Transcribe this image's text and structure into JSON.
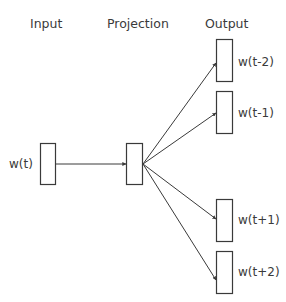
{
  "diagram": {
    "type": "skip-gram",
    "headers": {
      "input": "Input",
      "projection": "Projection",
      "output": "Output"
    },
    "input_node": {
      "label": "w(t)"
    },
    "projection_node": {
      "label": ""
    },
    "output_nodes": [
      {
        "label": "w(t-2)"
      },
      {
        "label": "w(t-1)"
      },
      {
        "label": "w(t+1)"
      },
      {
        "label": "w(t+2)"
      }
    ],
    "colors": {
      "stroke": "#3a3a3a",
      "text": "#3a3a3a",
      "background": "#ffffff"
    }
  }
}
